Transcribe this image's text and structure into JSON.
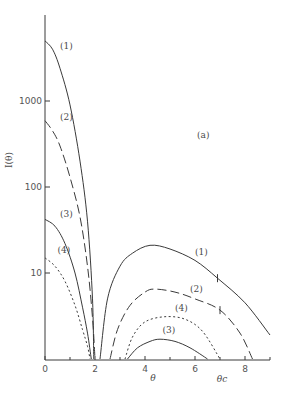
{
  "chart_data": {
    "type": "line",
    "title": "",
    "panel_label": "(a)",
    "xlabel": "θ",
    "ylabel": "I(θ)",
    "x_annotation": "θc",
    "x_annotation_value": 7.0,
    "xlim": [
      0,
      9
    ],
    "ylim": [
      1,
      10000
    ],
    "yscale": "log",
    "grid": false,
    "legend": "inline labels",
    "x_ticks": [
      0,
      2,
      4,
      6,
      8
    ],
    "x_tick_labels": [
      "0",
      "2",
      "4",
      "6",
      "8"
    ],
    "x_minor_ticks": [
      1,
      3,
      5,
      7,
      9
    ],
    "y_ticks": [
      10,
      100,
      1000
    ],
    "y_tick_labels": [
      "10",
      "100",
      "1000"
    ],
    "series": [
      {
        "name": "(1)",
        "style": "solid",
        "label_pos": {
          "x": 0.6,
          "y": 4000
        },
        "label_pos_right": {
          "x": 6.0,
          "y": 16
        },
        "segments": [
          {
            "x": [
              0,
              0.3,
              0.6,
              1.0,
              1.4,
              1.7,
              1.9,
              1.95
            ],
            "y": [
              5000,
              4000,
              2400,
              900,
              200,
              40,
              5,
              1
            ]
          },
          {
            "x": [
              2.2,
              2.5,
              3.0,
              3.5,
              4.2,
              5.0,
              6.0,
              6.9,
              8.0,
              9.0
            ],
            "y": [
              1,
              5,
              12,
              17,
              21,
              19,
              14,
              8.7,
              4.5,
              1.9
            ]
          }
        ],
        "marker_tick": {
          "x": 6.9,
          "y": 8.7
        }
      },
      {
        "name": "(2)",
        "style": "dashed",
        "label_pos": {
          "x": 0.6,
          "y": 600
        },
        "label_pos_right": {
          "x": 5.8,
          "y": 6
        },
        "segments": [
          {
            "x": [
              0,
              0.3,
              0.6,
              1.0,
              1.4,
              1.7,
              1.9,
              2.0
            ],
            "y": [
              590,
              450,
              300,
              130,
              45,
              12,
              3,
              1
            ]
          },
          {
            "x": [
              2.6,
              2.9,
              3.4,
              4.0,
              4.4,
              5.2,
              6.0,
              7.0,
              7.8,
              8.3
            ],
            "y": [
              1,
              2.2,
              4.2,
              6.0,
              6.5,
              6.0,
              5.0,
              3.7,
              2.0,
              1
            ]
          }
        ],
        "marker_tick": {
          "x": 7.0,
          "y": 3.7
        }
      },
      {
        "name": "(3)",
        "style": "solid",
        "label_pos": {
          "x": 0.6,
          "y": 45
        },
        "label_pos_right": {
          "x": 4.7,
          "y": 2.0
        },
        "segments": [
          {
            "x": [
              0,
              0.4,
              0.8,
              1.2,
              1.5,
              1.7,
              1.85
            ],
            "y": [
              42,
              35,
              22,
              10,
              4,
              2,
              1
            ]
          },
          {
            "x": [
              3.3,
              3.7,
              4.2,
              4.6,
              5.2,
              5.8,
              6.5
            ],
            "y": [
              1,
              1.35,
              1.6,
              1.7,
              1.6,
              1.35,
              1
            ]
          }
        ]
      },
      {
        "name": "(4)",
        "style": "dotted",
        "label_pos": {
          "x": 0.5,
          "y": 17
        },
        "label_pos_right": {
          "x": 5.2,
          "y": 3.6
        },
        "segments": [
          {
            "x": [
              0,
              0.4,
              0.8,
              1.2,
              1.5,
              1.7,
              1.8
            ],
            "y": [
              15,
              12,
              8,
              4.2,
              2.2,
              1.4,
              1
            ]
          },
          {
            "x": [
              3.2,
              3.5,
              4.0,
              4.8,
              5.6,
              6.3,
              7.0
            ],
            "y": [
              1,
              1.8,
              2.7,
              3.1,
              2.9,
              2.1,
              1
            ]
          }
        ]
      }
    ]
  }
}
